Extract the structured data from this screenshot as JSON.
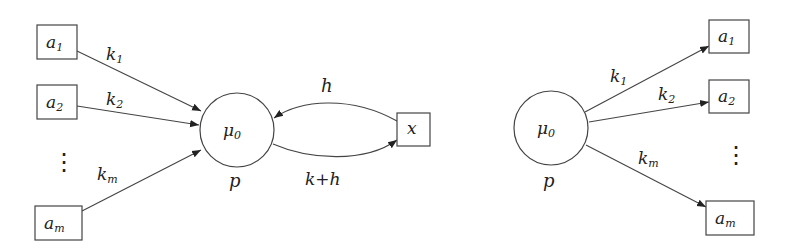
{
  "diagram": {
    "left": {
      "center_node": {
        "label": "μ",
        "sub": "0",
        "below": "p"
      },
      "inputs": [
        {
          "label": "a",
          "sub": "1",
          "edge_label": "k",
          "edge_sub": "1"
        },
        {
          "label": "a",
          "sub": "2",
          "edge_label": "k",
          "edge_sub": "2"
        },
        {
          "label": "a",
          "sub": "m",
          "edge_label": "k",
          "edge_sub": "m"
        }
      ],
      "ellipsis": "⋮",
      "loop_node": {
        "label": "x"
      },
      "loop_in_label": "h",
      "loop_out_label": "k+h"
    },
    "right": {
      "center_node": {
        "label": "μ",
        "sub": "0",
        "below": "p"
      },
      "outputs": [
        {
          "label": "a",
          "sub": "1",
          "edge_label": "k",
          "edge_sub": "1"
        },
        {
          "label": "a",
          "sub": "2",
          "edge_label": "k",
          "edge_sub": "2"
        },
        {
          "label": "a",
          "sub": "m",
          "edge_label": "k",
          "edge_sub": "m"
        }
      ],
      "ellipsis": "⋮"
    }
  }
}
